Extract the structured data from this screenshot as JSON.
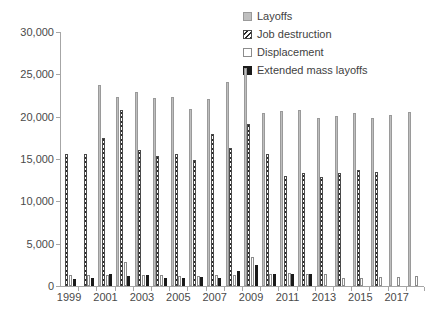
{
  "chart_data": {
    "type": "bar",
    "title": "",
    "subtitle": "",
    "xlabel": "",
    "ylabel": "",
    "ylim": [
      0,
      30000
    ],
    "ytick_values": [
      0,
      5000,
      10000,
      15000,
      20000,
      25000,
      30000
    ],
    "ytick_labels": [
      "0",
      "5,000",
      "10,000",
      "15,000",
      "20,000",
      "25,000",
      "30,000"
    ],
    "grid": false,
    "legend_position": "top-right",
    "categories": [
      "1999",
      "2000",
      "2001",
      "2002",
      "2003",
      "2004",
      "2005",
      "2006",
      "2007",
      "2008",
      "2009",
      "2010",
      "2011",
      "2012",
      "2013",
      "2014",
      "2015",
      "2016",
      "2017",
      "2018"
    ],
    "xtick_labels_shown": [
      "1999",
      "2001",
      "2003",
      "2005",
      "2007",
      "2009",
      "2011",
      "2013",
      "2015",
      "2017"
    ],
    "series": [
      {
        "name": "Layoffs",
        "color": "#bfbfbf",
        "pattern": "solid-gray",
        "values": [
          null,
          null,
          23700,
          22350,
          22950,
          22250,
          22300,
          20900,
          22100,
          24150,
          25800,
          20450,
          20700,
          20800,
          19850,
          20100,
          20400,
          19900,
          20250,
          20550
        ]
      },
      {
        "name": "Job destruction",
        "color": "#2b2b2b",
        "pattern": "diagonal-hatch",
        "values": [
          15600,
          15600,
          17450,
          20750,
          16050,
          15400,
          15550,
          14850,
          17900,
          16300,
          19100,
          15550,
          12950,
          13400,
          12850,
          13350,
          13650,
          13500,
          null,
          null
        ]
      },
      {
        "name": "Displacement",
        "color": "#ffffff",
        "pattern": "open",
        "values": [
          1350,
          1250,
          1300,
          2800,
          1250,
          1300,
          1200,
          1200,
          1300,
          1300,
          3400,
          1450,
          1500,
          1400,
          1450,
          1000,
          1000,
          1100,
          1050,
          1150
        ]
      },
      {
        "name": "Extended mass layoffs",
        "color": "#1a1a1a",
        "pattern": "solid-black",
        "values": [
          850,
          900,
          1400,
          1200,
          1250,
          950,
          900,
          1050,
          1000,
          1750,
          2500,
          1450,
          1400,
          1400,
          null,
          null,
          null,
          null,
          null,
          null
        ]
      }
    ]
  },
  "legend": {
    "items": [
      {
        "label": "Layoffs",
        "swatch": "layoffs-swatch"
      },
      {
        "label": "Job destruction",
        "swatch": "job-destruction-swatch"
      },
      {
        "label": "Displacement",
        "swatch": "displacement-swatch"
      },
      {
        "label": "Extended mass layoffs",
        "swatch": "extended-mass-layoffs-swatch"
      }
    ]
  }
}
